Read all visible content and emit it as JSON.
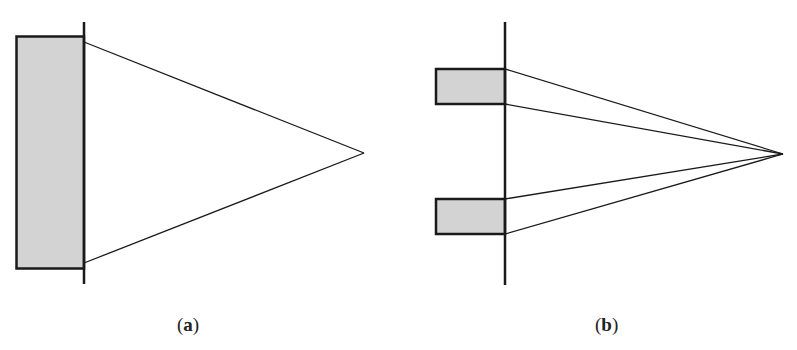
{
  "figure": {
    "panels": [
      {
        "id": "a",
        "caption_open": "(",
        "caption_letter": "a",
        "caption_close": ")",
        "description": "Single wide aperture with lines converging from its edges to a focal point",
        "aperture_count": 1
      },
      {
        "id": "b",
        "caption_open": "(",
        "caption_letter": "b",
        "caption_close": ")",
        "description": "Two narrow apertures with lines from each edge converging to a focal point",
        "aperture_count": 2
      }
    ],
    "colors": {
      "stroke": "#1a1a1a",
      "fill": "#d3d3d3",
      "background": "#ffffff"
    }
  }
}
